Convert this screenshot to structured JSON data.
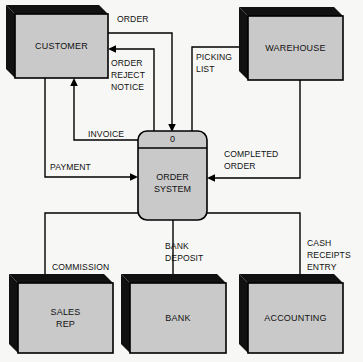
{
  "diagram": {
    "type": "data-flow-diagram",
    "colors": {
      "background": "#f7f7f5",
      "entity_fill": "#c9c9c9",
      "entity_shadow": "#111111",
      "stroke": "#000000",
      "text": "#111111"
    },
    "process": {
      "number": "0",
      "name_line1": "ORDER",
      "name_line2": "SYSTEM"
    },
    "entities": [
      {
        "id": "customer",
        "label": "CUSTOMER",
        "position": "top-left"
      },
      {
        "id": "warehouse",
        "label": "WAREHOUSE",
        "position": "top-right"
      },
      {
        "id": "sales_rep",
        "label_line1": "SALES",
        "label_line2": "REP",
        "position": "bottom-left"
      },
      {
        "id": "bank",
        "label": "BANK",
        "position": "bottom-center"
      },
      {
        "id": "accounting",
        "label": "ACCOUNTING",
        "position": "bottom-right"
      }
    ],
    "flows": [
      {
        "id": "order",
        "label": "ORDER",
        "from": "customer",
        "to": "process"
      },
      {
        "id": "order_reject_notice",
        "label_line1": "ORDER",
        "label_line2": "REJECT",
        "label_line3": "NOTICE",
        "from": "process",
        "to": "customer"
      },
      {
        "id": "invoice",
        "label": "INVOICE",
        "from": "process",
        "to": "customer"
      },
      {
        "id": "payment",
        "label": "PAYMENT",
        "from": "customer",
        "to": "process"
      },
      {
        "id": "picking_list",
        "label_line1": "PICKING",
        "label_line2": "LIST",
        "from": "process",
        "to": "warehouse"
      },
      {
        "id": "completed_order",
        "label_line1": "COMPLETED",
        "label_line2": "ORDER",
        "from": "warehouse",
        "to": "process"
      },
      {
        "id": "commission",
        "label": "COMMISSION",
        "from": "process",
        "to": "sales_rep"
      },
      {
        "id": "bank_deposit",
        "label_line1": "BANK",
        "label_line2": "DEPOSIT",
        "from": "process",
        "to": "bank"
      },
      {
        "id": "cash_receipts_entry",
        "label_line1": "CASH",
        "label_line2": "RECEIPTS",
        "label_line3": "ENTRY",
        "from": "process",
        "to": "accounting"
      }
    ]
  }
}
